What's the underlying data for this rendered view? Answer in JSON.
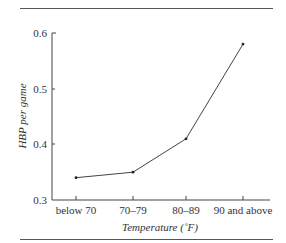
{
  "chart_data": {
    "type": "line",
    "title": "",
    "xlabel": "Temperature (˚F)",
    "ylabel": "HBP per game",
    "categories": [
      "below 70",
      "70–79",
      "80–89",
      "90 and above"
    ],
    "series": [
      {
        "name": "HBP per game",
        "values": [
          0.34,
          0.35,
          0.41,
          0.58
        ]
      }
    ],
    "ylim": [
      0.3,
      0.6
    ],
    "yticks": [
      "0.3",
      "0.4",
      "0.5",
      "0.6"
    ],
    "grid": false,
    "legend": "none",
    "markers": true,
    "line_color": "#444444"
  },
  "axes": {
    "xlabel": "Temperature (˚F)",
    "ylabel": "HBP per game",
    "yticks": [
      "0.3",
      "0.4",
      "0.5",
      "0.6"
    ],
    "xticks": [
      "below 70",
      "70–79",
      "80–89",
      "90 and above"
    ]
  }
}
